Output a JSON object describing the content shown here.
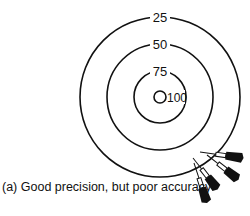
{
  "diagram": {
    "rings": [
      {
        "label": "25",
        "radius": 80
      },
      {
        "label": "50",
        "radius": 53
      },
      {
        "label": "75",
        "radius": 26
      },
      {
        "label": "100",
        "radius": 6
      }
    ],
    "darts_count": 4,
    "caption": "(a)  Good precision, but poor accuracy",
    "colors": {
      "stroke": "#111111",
      "background": "#ffffff"
    }
  }
}
